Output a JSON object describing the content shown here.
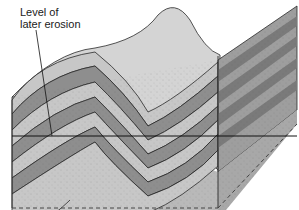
{
  "diagram": {
    "annotation": {
      "line1": "Level of",
      "line2": "later erosion"
    },
    "colors": {
      "light_layer": "#c9c9c9",
      "dark_layer": "#8f8f8f",
      "surface": "#d6d6d6",
      "basement": "#b8b8b8",
      "outline": "#2a2a2a",
      "right_face_light": "#a9a9a9",
      "right_face_dark": "#7c7c7c"
    }
  }
}
